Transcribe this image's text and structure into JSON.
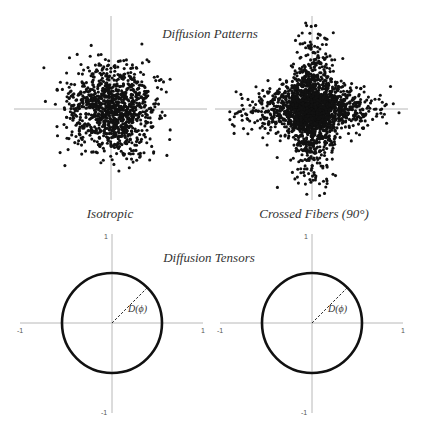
{
  "canvas": {
    "width": 422,
    "height": 425,
    "background": "#ffffff"
  },
  "titles": {
    "patterns": "Diffusion Patterns",
    "tensors": "Diffusion Tensors"
  },
  "panels": [
    {
      "id": "isotropic",
      "label": "Isotropic",
      "scatter": {
        "center": [
          111,
          109
        ],
        "axis_h": [
          14,
          207
        ],
        "axis_v": [
          16,
          200
        ],
        "dot_radius": 1.55,
        "dot_color": "#111111",
        "seed": 17,
        "clusters": [
          {
            "n": 1100,
            "sx": 22,
            "sy": 22
          }
        ],
        "clip": 68
      },
      "tensor": {
        "center": [
          112,
          323
        ],
        "radius": 50,
        "axis_h": [
          20,
          203
        ],
        "axis_v": [
          234,
          413
        ],
        "radius_label": "D(ϕ)",
        "ticks": {
          "x_min": "-1",
          "x_max": "1",
          "y_max": "1",
          "y_min": "-1"
        }
      }
    },
    {
      "id": "crossed-fibers",
      "label": "Crossed Fibers (90°)",
      "scatter": {
        "center": [
          312,
          109
        ],
        "axis_h": [
          215,
          408
        ],
        "axis_v": [
          16,
          200
        ],
        "dot_radius": 1.55,
        "dot_color": "#111111",
        "seed": 91,
        "clusters": [
          {
            "n": 900,
            "sx": 34,
            "sy": 11
          },
          {
            "n": 900,
            "sx": 11,
            "sy": 32
          },
          {
            "n": 500,
            "sx": 15,
            "sy": 15
          }
        ],
        "clip": 88
      },
      "tensor": {
        "center": [
          312,
          323
        ],
        "radius": 50,
        "axis_h": [
          220,
          403
        ],
        "axis_v": [
          234,
          413
        ],
        "radius_label": "D(ϕ)",
        "ticks": {
          "x_min": "-1",
          "x_max": "1",
          "y_max": "1",
          "y_min": "-1"
        }
      }
    }
  ]
}
